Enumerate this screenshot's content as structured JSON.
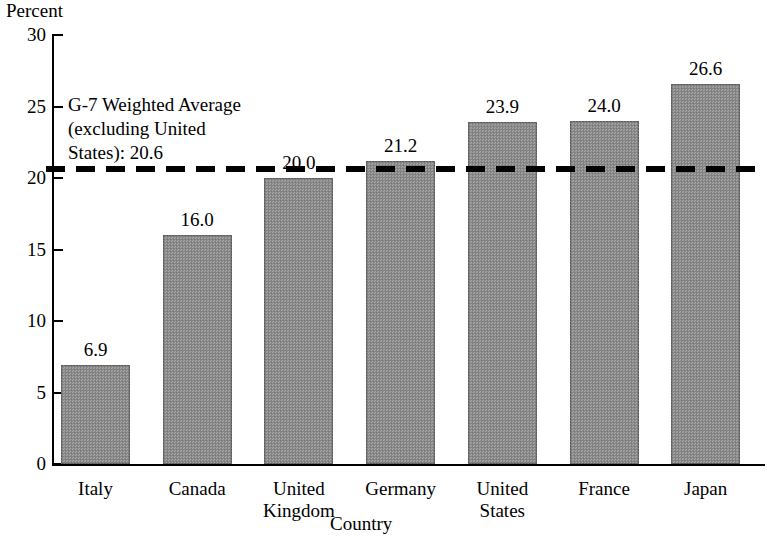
{
  "chart_data": {
    "type": "bar",
    "title": "",
    "xlabel": "Country",
    "ylabel": "Percent",
    "categories": [
      "Italy",
      "Canada",
      "United Kingdom",
      "Germany",
      "United States",
      "France",
      "Japan"
    ],
    "category_lines": [
      [
        "Italy"
      ],
      [
        "Canada"
      ],
      [
        "United",
        "Kingdom"
      ],
      [
        "Germany"
      ],
      [
        "United",
        "States"
      ],
      [
        "France"
      ],
      [
        "Japan"
      ]
    ],
    "values": [
      6.9,
      16.0,
      20.0,
      21.2,
      23.9,
      24.0,
      26.6
    ],
    "value_labels": [
      "6.9",
      "16.0",
      "20.0",
      "21.2",
      "23.9",
      "24.0",
      "26.6"
    ],
    "ylim": [
      0,
      30
    ],
    "ytick_values": [
      0,
      5,
      10,
      15,
      20,
      25,
      30
    ],
    "ytick_labels": [
      "0",
      "5",
      "10",
      "15",
      "20",
      "25",
      "30"
    ],
    "grid": false,
    "legend": "none",
    "bar_color": "#8d8d8d",
    "annotations": [
      {
        "name": "g7-weighted-average",
        "text": "G-7 Weighted Average (excluding United States): 20.6",
        "lines": [
          "G-7 Weighted Average",
          "(excluding United",
          "States): 20.6"
        ],
        "value": 20.6,
        "style": "dashed-horizontal-line",
        "color": "#000000"
      }
    ]
  }
}
